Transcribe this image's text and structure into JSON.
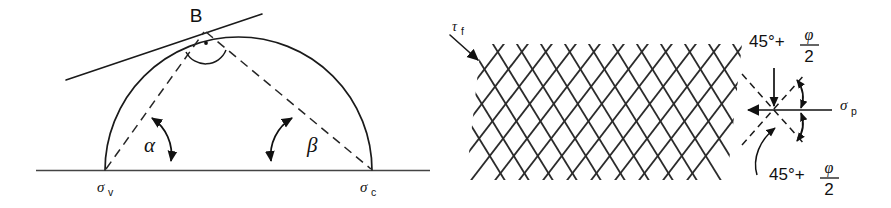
{
  "figure": {
    "domain": "diagram",
    "background_color": "#ffffff",
    "ink_color": "#1a1a1a",
    "width": 891,
    "height": 208
  },
  "left_panel": {
    "name": "mohr-circle-construction",
    "apex_label": "B",
    "angle_alpha": "α",
    "angle_beta": "β",
    "axis_left_stress": {
      "symbol": "σ",
      "subscript": "v"
    },
    "axis_right_stress": {
      "symbol": "σ",
      "subscript": "c"
    },
    "right_angle_marker": "·",
    "elements": [
      "baseline-axis",
      "semicircle",
      "tangent-line",
      "dashed-chord-left",
      "dashed-chord-right",
      "alpha-angle-arrow",
      "beta-angle-arrow"
    ]
  },
  "right_panel": {
    "name": "shear-failure-planes",
    "shear_stress": {
      "symbol": "τ",
      "subscript": "f"
    },
    "principal_stress": {
      "symbol": "σ",
      "subscript": "p"
    },
    "angle_top": {
      "base": "45°+",
      "numerator": "φ",
      "denominator": "2"
    },
    "angle_bottom": {
      "base": "45°+",
      "numerator": "φ",
      "denominator": "2"
    },
    "elements": [
      "cross-hatch-failure-grid",
      "tau-f-arrow",
      "stress-element",
      "vertical-load-arrow",
      "horizontal-load-arrow",
      "angle-arc-upper",
      "angle-arc-lower",
      "leader-line-lower"
    ]
  }
}
